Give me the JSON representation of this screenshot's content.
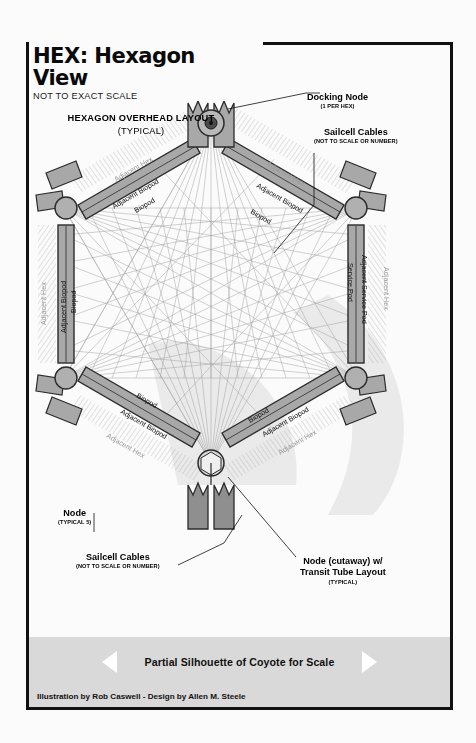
{
  "header": {
    "title": "HEX: Hexagon View",
    "subtitle": "NOT TO EXACT SCALE"
  },
  "layout_caption": {
    "line1": "HEXAGON OVERHEAD LAYOUT",
    "line2": "(TYPICAL)"
  },
  "callouts": [
    {
      "id": "docking-node",
      "main": "Docking Node",
      "qual": "(1 PER HEX)"
    },
    {
      "id": "sailcell-top",
      "main": "Sailcell Cables",
      "qual": "(NOT TO SCALE OR NUMBER)"
    },
    {
      "id": "node",
      "main": "Node",
      "qual": "(TYPICAL 5)"
    },
    {
      "id": "sailcell-bottom",
      "main": "Sailcell Cables",
      "qual": "(NOT TO SCALE OR NUMBER)"
    },
    {
      "id": "cutaway-node",
      "main": "Node (cutaway) w/",
      "main2": "Transit Tube Layout",
      "qual": "(TYPICAL)"
    }
  ],
  "scale_band": {
    "label": "Partial Silhouette of Coyote for Scale",
    "left_arrow": "triangle-left-icon",
    "right_arrow": "triangle-right-icon"
  },
  "credit": "Illustration by Rob Caswell - Design by Allen M. Steele",
  "arm_labels": {
    "upper_left": [
      "Adjacent Hex",
      "Adjacent Biopod",
      "Biopod"
    ],
    "upper_right": [
      "Adjacent Hex",
      "Adjacent Biopod",
      "Biopod"
    ],
    "left": [
      "Adjacent Hex",
      "Adjacent Biopod",
      "Biopod"
    ],
    "right": [
      "Adjacent Hex",
      "Adjacent Service Pod",
      "Service Pod"
    ],
    "lower_left": [
      "Adjacent Hex",
      "Adjacent Biopod",
      "Biopod"
    ],
    "lower_right": [
      "Adjacent Hex",
      "Adjacent Biopod",
      "Biopod"
    ]
  },
  "colors": {
    "ink": "#111111",
    "arm_fill": "#a8a8a8",
    "node_fill": "#b0b0b0",
    "band": "#d9d9d9",
    "paper": "#fbfbfb",
    "cable": "#8f8f8f",
    "silhouette": "#dedede"
  },
  "structure": {
    "node_count": 6,
    "arm_count": 6,
    "docking_nodes": 1
  }
}
